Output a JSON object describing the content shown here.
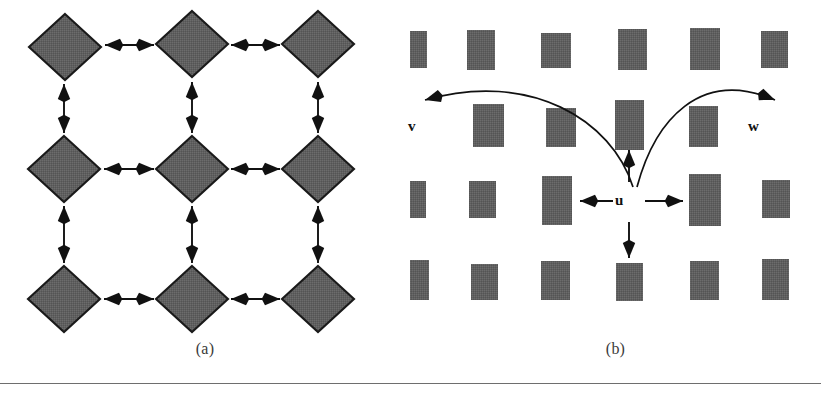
{
  "figure": {
    "background_color": "#ffffff",
    "shape_fill_color": "#5f5f5f",
    "shape_stroke_color": "#1a1a1a",
    "arrow_color": "#111111",
    "rule_color": "#6e6e6e",
    "width": 821,
    "height": 395
  },
  "panel_a": {
    "caption": "(a)",
    "node_shape": "diamond",
    "grid": {
      "rows": 3,
      "cols": 3
    },
    "nodes": [
      {
        "id": "a-r0c0",
        "name": "diamond-node-r0c0",
        "cx": 65,
        "cy": 47,
        "rx": 36,
        "ry": 33
      },
      {
        "id": "a-r0c1",
        "name": "diamond-node-r0c1",
        "cx": 192,
        "cy": 44,
        "rx": 36,
        "ry": 33
      },
      {
        "id": "a-r0c2",
        "name": "diamond-node-r0c2",
        "cx": 318,
        "cy": 44,
        "rx": 36,
        "ry": 33
      },
      {
        "id": "a-r1c0",
        "name": "diamond-node-r1c0",
        "cx": 64,
        "cy": 169,
        "rx": 36,
        "ry": 33
      },
      {
        "id": "a-r1c1",
        "name": "diamond-node-r1c1",
        "cx": 192,
        "cy": 169,
        "rx": 36,
        "ry": 33
      },
      {
        "id": "a-r1c2",
        "name": "diamond-node-r1c2",
        "cx": 318,
        "cy": 169,
        "rx": 36,
        "ry": 33
      },
      {
        "id": "a-r2c0",
        "name": "diamond-node-r2c0",
        "cx": 64,
        "cy": 299,
        "rx": 36,
        "ry": 33
      },
      {
        "id": "a-r2c1",
        "name": "diamond-node-r2c1",
        "cx": 192,
        "cy": 299,
        "rx": 36,
        "ry": 33
      },
      {
        "id": "a-r2c2",
        "name": "diamond-node-r2c2",
        "cx": 318,
        "cy": 299,
        "rx": 36,
        "ry": 33
      }
    ],
    "edges": [
      {
        "name": "edge-h-r0c0-r0c1",
        "orientation": "horizontal",
        "x1": 105,
        "y1": 45,
        "x2": 154,
        "y2": 45
      },
      {
        "name": "edge-h-r0c1-r0c2",
        "orientation": "horizontal",
        "x1": 231,
        "y1": 45,
        "x2": 280,
        "y2": 45
      },
      {
        "name": "edge-h-r1c0-r1c1",
        "orientation": "horizontal",
        "x1": 104,
        "y1": 169,
        "x2": 154,
        "y2": 169
      },
      {
        "name": "edge-h-r1c1-r1c2",
        "orientation": "horizontal",
        "x1": 231,
        "y1": 169,
        "x2": 280,
        "y2": 169
      },
      {
        "name": "edge-h-r2c0-r2c1",
        "orientation": "horizontal",
        "x1": 104,
        "y1": 299,
        "x2": 154,
        "y2": 299
      },
      {
        "name": "edge-h-r2c1-r2c2",
        "orientation": "horizontal",
        "x1": 231,
        "y1": 299,
        "x2": 280,
        "y2": 299
      },
      {
        "name": "edge-v-r0c0-r1c0",
        "orientation": "vertical",
        "x1": 64,
        "y1": 84,
        "x2": 64,
        "y2": 133
      },
      {
        "name": "edge-v-r0c1-r1c1",
        "orientation": "vertical",
        "x1": 192,
        "y1": 82,
        "x2": 192,
        "y2": 133
      },
      {
        "name": "edge-v-r0c2-r1c2",
        "orientation": "vertical",
        "x1": 318,
        "y1": 82,
        "x2": 318,
        "y2": 133
      },
      {
        "name": "edge-v-r1c0-r2c0",
        "orientation": "vertical",
        "x1": 64,
        "y1": 206,
        "x2": 64,
        "y2": 263
      },
      {
        "name": "edge-v-r1c1-r2c1",
        "orientation": "vertical",
        "x1": 192,
        "y1": 206,
        "x2": 192,
        "y2": 263
      },
      {
        "name": "edge-v-r1c2-r2c2",
        "orientation": "vertical",
        "x1": 318,
        "y1": 206,
        "x2": 318,
        "y2": 263
      }
    ],
    "edge_style": "double-headed-arrow",
    "edge_count": 12,
    "node_count": 9
  },
  "panel_b": {
    "caption": "(b)",
    "node_shape": "rectangle",
    "grid": {
      "rows": 4,
      "cols": 6
    },
    "labels": [
      {
        "id": "label-v",
        "name": "node-label-v",
        "text": "v",
        "left": 408,
        "top": 118
      },
      {
        "id": "label-u",
        "name": "node-label-u",
        "text": "u",
        "left": 615,
        "top": 192
      },
      {
        "id": "label-w",
        "name": "node-label-w",
        "text": "w",
        "left": 748,
        "top": 118
      }
    ],
    "rectangles": [
      {
        "name": "rect-r0c0",
        "x": 401,
        "y": 31,
        "w": 26,
        "h": 37
      },
      {
        "name": "rect-r0c1",
        "x": 467,
        "y": 30,
        "w": 28,
        "h": 40
      },
      {
        "name": "rect-r0c2",
        "x": 541,
        "y": 33,
        "w": 30,
        "h": 35
      },
      {
        "name": "rect-r0c3",
        "x": 618,
        "y": 29,
        "w": 29,
        "h": 41
      },
      {
        "name": "rect-r0c4",
        "x": 690,
        "y": 28,
        "w": 30,
        "h": 42
      },
      {
        "name": "rect-r0c5",
        "x": 761,
        "y": 31,
        "w": 27,
        "h": 37
      },
      {
        "name": "rect-r1c1",
        "x": 473,
        "y": 104,
        "w": 31,
        "h": 43
      },
      {
        "name": "rect-r1c2",
        "x": 546,
        "y": 108,
        "w": 30,
        "h": 39
      },
      {
        "name": "rect-r1c3",
        "x": 615,
        "y": 100,
        "w": 29,
        "h": 50
      },
      {
        "name": "rect-r1c4",
        "x": 689,
        "y": 106,
        "w": 29,
        "h": 41
      },
      {
        "name": "rect-r2c0",
        "x": 400,
        "y": 181,
        "w": 26,
        "h": 37
      },
      {
        "name": "rect-r2c1",
        "x": 469,
        "y": 181,
        "w": 27,
        "h": 37
      },
      {
        "name": "rect-r2c2",
        "x": 542,
        "y": 176,
        "w": 30,
        "h": 49
      },
      {
        "name": "rect-r2c3",
        "x": 689,
        "y": 174,
        "w": 32,
        "h": 52
      },
      {
        "name": "rect-r2c4",
        "x": 762,
        "y": 180,
        "w": 28,
        "h": 38
      },
      {
        "name": "rect-r3c0",
        "x": 400,
        "y": 260,
        "w": 29,
        "h": 40
      },
      {
        "name": "rect-r3c1",
        "x": 471,
        "y": 264,
        "w": 27,
        "h": 36
      },
      {
        "name": "rect-r3c2",
        "x": 541,
        "y": 261,
        "w": 29,
        "h": 39
      },
      {
        "name": "rect-r3c3",
        "x": 616,
        "y": 263,
        "w": 27,
        "h": 38
      },
      {
        "name": "rect-r3c4",
        "x": 690,
        "y": 261,
        "w": 29,
        "h": 39
      },
      {
        "name": "rect-r3c5",
        "x": 762,
        "y": 259,
        "w": 27,
        "h": 41
      }
    ],
    "straight_arrows": [
      {
        "name": "arrow-u-left",
        "direction": "left",
        "x1": 613,
        "y1": 201,
        "x2": 580,
        "y2": 201
      },
      {
        "name": "arrow-u-right",
        "direction": "right",
        "x1": 645,
        "y1": 201,
        "x2": 683,
        "y2": 201
      },
      {
        "name": "arrow-u-up",
        "direction": "up",
        "x1": 629,
        "y1": 182,
        "x2": 629,
        "y2": 150
      },
      {
        "name": "arrow-u-down",
        "direction": "down",
        "x1": 629,
        "y1": 222,
        "x2": 629,
        "y2": 258
      }
    ],
    "curved_arrows": [
      {
        "name": "curved-arrow-u-to-v",
        "from": "u",
        "to": "v",
        "path": "M 633 187 C 612 120, 530 70, 425 100"
      },
      {
        "name": "curved-arrow-u-to-w",
        "from": "u",
        "to": "w",
        "path": "M 637 187 C 655 120, 700 68, 775 100"
      }
    ],
    "rect_count": 21,
    "straight_arrow_count": 4,
    "curved_arrow_count": 2
  }
}
